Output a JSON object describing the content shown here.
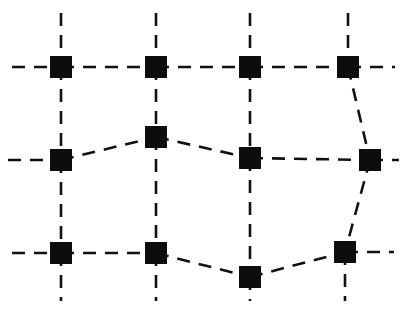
{
  "figure": {
    "type": "node-link-mesh-diagram",
    "background_color": "#ffffff",
    "line_color": "#111111",
    "node_fill_color": "#0d0d0d",
    "node_shape": "square",
    "node_size_px": 22,
    "line_style": "dashed",
    "line_width_px": 2.6,
    "dash_pattern": "13 9",
    "width_px": 407,
    "height_px": 328
  },
  "chart_data": {
    "type": "scatter",
    "title": "",
    "xlabel": "",
    "ylabel": "",
    "xlim": [
      0,
      407
    ],
    "ylim": [
      0,
      328
    ],
    "grid": false,
    "legend": "none",
    "nodes": [
      {
        "id": "n-r1c1",
        "row": 1,
        "col": 1,
        "x": 61,
        "y": 67
      },
      {
        "id": "n-r1c2",
        "row": 1,
        "col": 2,
        "x": 156,
        "y": 67
      },
      {
        "id": "n-r1c3",
        "row": 1,
        "col": 3,
        "x": 250,
        "y": 67
      },
      {
        "id": "n-r1c4",
        "row": 1,
        "col": 4,
        "x": 348,
        "y": 67
      },
      {
        "id": "n-r2c1",
        "row": 2,
        "col": 1,
        "x": 61,
        "y": 160
      },
      {
        "id": "n-r2c2",
        "row": 2,
        "col": 2,
        "x": 156,
        "y": 137
      },
      {
        "id": "n-r2c3",
        "row": 2,
        "col": 3,
        "x": 250,
        "y": 158
      },
      {
        "id": "n-r2c4",
        "row": 2,
        "col": 4,
        "x": 370,
        "y": 160
      },
      {
        "id": "n-r3c1",
        "row": 3,
        "col": 1,
        "x": 61,
        "y": 253
      },
      {
        "id": "n-r3c2",
        "row": 3,
        "col": 2,
        "x": 156,
        "y": 253
      },
      {
        "id": "n-r3c3",
        "row": 3,
        "col": 3,
        "x": 250,
        "y": 277
      },
      {
        "id": "n-r3c4",
        "row": 3,
        "col": 4,
        "x": 345,
        "y": 252
      }
    ],
    "edges": [
      {
        "id": "e-r1-c1-c2",
        "from": "n-r1c1",
        "to": "n-r1c2"
      },
      {
        "id": "e-r1-c2-c3",
        "from": "n-r1c2",
        "to": "n-r1c3"
      },
      {
        "id": "e-r1-c3-c4",
        "from": "n-r1c3",
        "to": "n-r1c4"
      },
      {
        "id": "e-r2-c1-c2",
        "from": "n-r2c1",
        "to": "n-r2c2"
      },
      {
        "id": "e-r2-c2-c3",
        "from": "n-r2c2",
        "to": "n-r2c3"
      },
      {
        "id": "e-r2-c3-c4",
        "from": "n-r2c3",
        "to": "n-r2c4"
      },
      {
        "id": "e-r3-c1-c2",
        "from": "n-r3c1",
        "to": "n-r3c2"
      },
      {
        "id": "e-r3-c2-c3",
        "from": "n-r3c2",
        "to": "n-r3c3"
      },
      {
        "id": "e-r3-c3-c4",
        "from": "n-r3c3",
        "to": "n-r3c4"
      },
      {
        "id": "e-c1-r1-r2",
        "from": "n-r1c1",
        "to": "n-r2c1"
      },
      {
        "id": "e-c1-r2-r3",
        "from": "n-r2c1",
        "to": "n-r3c1"
      },
      {
        "id": "e-c2-r1-r2",
        "from": "n-r1c2",
        "to": "n-r2c2"
      },
      {
        "id": "e-c2-r2-r3",
        "from": "n-r2c2",
        "to": "n-r3c2"
      },
      {
        "id": "e-c3-r1-r2",
        "from": "n-r1c3",
        "to": "n-r2c3"
      },
      {
        "id": "e-c3-r2-r3",
        "from": "n-r2c3",
        "to": "n-r3c3"
      },
      {
        "id": "e-c4-r1-r2",
        "from": "n-r1c4",
        "to": "n-r2c4"
      },
      {
        "id": "e-c4-r2-r3",
        "from": "n-r2c4",
        "to": "n-r3c4"
      }
    ],
    "boundary_stubs": [
      {
        "id": "s-top-c1",
        "x1": 61,
        "y1": 13,
        "x2": 61,
        "y2": 67
      },
      {
        "id": "s-top-c2",
        "x1": 156,
        "y1": 13,
        "x2": 156,
        "y2": 67
      },
      {
        "id": "s-top-c3",
        "x1": 250,
        "y1": 13,
        "x2": 250,
        "y2": 67
      },
      {
        "id": "s-top-c4",
        "x1": 348,
        "y1": 13,
        "x2": 348,
        "y2": 67
      },
      {
        "id": "s-bottom-c1",
        "x1": 61,
        "y1": 253,
        "x2": 61,
        "y2": 301
      },
      {
        "id": "s-bottom-c2",
        "x1": 156,
        "y1": 253,
        "x2": 156,
        "y2": 301
      },
      {
        "id": "s-bottom-c3",
        "x1": 250,
        "y1": 277,
        "x2": 250,
        "y2": 301
      },
      {
        "id": "s-bottom-c4",
        "x1": 345,
        "y1": 252,
        "x2": 345,
        "y2": 301
      },
      {
        "id": "s-left-r1",
        "x1": 12,
        "y1": 67,
        "x2": 61,
        "y2": 67
      },
      {
        "id": "s-left-r2",
        "x1": 8,
        "y1": 160,
        "x2": 61,
        "y2": 160
      },
      {
        "id": "s-left-r3",
        "x1": 12,
        "y1": 253,
        "x2": 61,
        "y2": 253
      },
      {
        "id": "s-right-r1",
        "x1": 348,
        "y1": 67,
        "x2": 395,
        "y2": 67
      },
      {
        "id": "s-right-r2",
        "x1": 370,
        "y1": 160,
        "x2": 399,
        "y2": 160
      },
      {
        "id": "s-right-r3",
        "x1": 345,
        "y1": 252,
        "x2": 394,
        "y2": 252
      }
    ]
  }
}
